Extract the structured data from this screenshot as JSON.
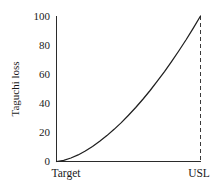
{
  "chart_data": {
    "type": "line",
    "title": "",
    "xlabel": "",
    "ylabel": "Taguchi loss",
    "ylim": [
      0,
      100
    ],
    "xlim": [
      0,
      1
    ],
    "grid": false,
    "legend": null,
    "y_ticks": [
      "0",
      "20",
      "40",
      "60",
      "80",
      "100"
    ],
    "y_tick_values": [
      0,
      20,
      40,
      60,
      80,
      100
    ],
    "x_tick_labels": [
      "Target",
      "USL"
    ],
    "x_tick_positions": [
      0,
      1
    ],
    "annotations": [
      {
        "name": "usl-dashed-line",
        "label": "USL",
        "x": 1,
        "style": "dashed-vertical"
      }
    ],
    "series": [
      {
        "name": "Taguchi loss curve",
        "exponent": 1.65,
        "x": [
          0,
          0.05,
          0.1,
          0.15,
          0.2,
          0.25,
          0.3,
          0.35,
          0.4,
          0.45,
          0.5,
          0.55,
          0.6,
          0.65,
          0.7,
          0.75,
          0.8,
          0.85,
          0.9,
          0.95,
          1
        ],
        "values": [
          0,
          0.8,
          2.4,
          4.5,
          7.2,
          10.3,
          13.9,
          17.8,
          22.1,
          26.7,
          31.8,
          37.1,
          42.8,
          48.8,
          55.2,
          61.8,
          68.8,
          76.1,
          83.7,
          91.7,
          100
        ]
      }
    ]
  },
  "axis": {
    "y_title": "Taguchi loss"
  },
  "labels": {
    "target": "Target",
    "usl": "USL"
  }
}
